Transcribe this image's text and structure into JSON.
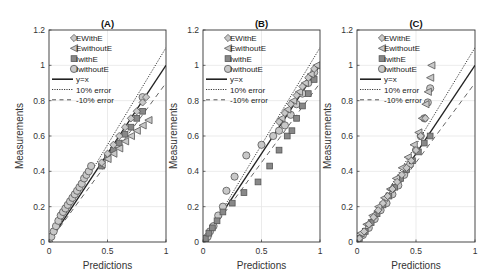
{
  "figure": {
    "x_label": "Predictions",
    "y_label": "Measurements",
    "x_ticks": [
      "0",
      "0.5",
      "1"
    ],
    "y_ticks": [
      "0",
      "0.2",
      "0.4",
      "0.6",
      "0.8",
      "1",
      "1.2"
    ],
    "legend": [
      "EWithE",
      "EwithoutE",
      "IwithE",
      "IwithoutE",
      "y=x",
      "10% error",
      "-10% error"
    ],
    "colors": {
      "marker_fill": "#c8c8c8",
      "marker_edge": "#555555",
      "line": "#222222",
      "grid": "#e6e6e6",
      "axes": "#333333"
    }
  },
  "chart_data": [
    {
      "type": "scatter",
      "title": "(A)",
      "xlabel": "Predictions",
      "ylabel": "Measurements",
      "xlim": [
        0,
        1
      ],
      "ylim": [
        0,
        1.2
      ],
      "grid": true,
      "legend_position": "upper left",
      "reference_lines": [
        {
          "name": "y=x",
          "slope": 1.0,
          "style": "solid"
        },
        {
          "name": "10% error",
          "slope": 1.1,
          "style": "dotted"
        },
        {
          "name": "-10% error",
          "slope": 0.9,
          "style": "dashed"
        }
      ],
      "series": [
        {
          "name": "EWithE",
          "marker": "diamond",
          "x": [
            0.45,
            0.5,
            0.55,
            0.6,
            0.65,
            0.7,
            0.75,
            0.8,
            0.83
          ],
          "y": [
            0.45,
            0.5,
            0.55,
            0.6,
            0.65,
            0.7,
            0.74,
            0.79,
            0.82
          ]
        },
        {
          "name": "EwithoutE",
          "marker": "triangle-left",
          "x": [
            0.45,
            0.5,
            0.55,
            0.6,
            0.65,
            0.7,
            0.75,
            0.8,
            0.85
          ],
          "y": [
            0.44,
            0.47,
            0.5,
            0.53,
            0.57,
            0.6,
            0.63,
            0.66,
            0.69
          ]
        },
        {
          "name": "IwithE",
          "marker": "square",
          "x": [
            0.45,
            0.5,
            0.55,
            0.6,
            0.65,
            0.7,
            0.75,
            0.8
          ],
          "y": [
            0.43,
            0.48,
            0.52,
            0.56,
            0.61,
            0.65,
            0.7,
            0.74
          ]
        },
        {
          "name": "IwithoutE",
          "marker": "circle",
          "x": [
            0.0,
            0.02,
            0.04,
            0.06,
            0.08,
            0.1,
            0.12,
            0.14,
            0.16,
            0.18,
            0.2,
            0.22,
            0.24,
            0.26,
            0.28,
            0.3,
            0.32,
            0.34,
            0.36,
            0.8
          ],
          "y": [
            0.0,
            0.03,
            0.06,
            0.09,
            0.12,
            0.15,
            0.17,
            0.19,
            0.21,
            0.23,
            0.25,
            0.27,
            0.29,
            0.31,
            0.33,
            0.36,
            0.38,
            0.4,
            0.43,
            0.82
          ]
        }
      ]
    },
    {
      "type": "scatter",
      "title": "(B)",
      "xlabel": "Predictions",
      "ylabel": "Measurements",
      "xlim": [
        0,
        1
      ],
      "ylim": [
        0,
        1.2
      ],
      "grid": true,
      "legend_position": "upper left",
      "reference_lines": [
        {
          "name": "y=x",
          "slope": 1.0,
          "style": "solid"
        },
        {
          "name": "10% error",
          "slope": 1.1,
          "style": "dotted"
        },
        {
          "name": "-10% error",
          "slope": 0.9,
          "style": "dashed"
        }
      ],
      "series": [
        {
          "name": "EWithE",
          "marker": "diamond",
          "x": [
            0.65,
            0.7,
            0.75,
            0.8,
            0.85,
            0.9,
            0.95
          ],
          "y": [
            0.68,
            0.73,
            0.78,
            0.83,
            0.88,
            0.93,
            0.98
          ]
        },
        {
          "name": "EwithoutE",
          "marker": "triangle-left",
          "x": [
            0.67,
            0.72,
            0.77,
            0.82,
            0.87,
            0.92,
            0.97
          ],
          "y": [
            0.7,
            0.75,
            0.8,
            0.85,
            0.9,
            0.95,
            1.0
          ]
        },
        {
          "name": "IwithE",
          "marker": "square",
          "x": [
            0.02,
            0.05,
            0.08,
            0.12,
            0.17,
            0.25,
            0.35,
            0.47,
            0.57,
            0.65,
            0.72,
            0.76,
            0.8,
            0.85,
            0.9,
            0.95
          ],
          "y": [
            0.02,
            0.05,
            0.08,
            0.12,
            0.17,
            0.22,
            0.28,
            0.34,
            0.43,
            0.52,
            0.6,
            0.63,
            0.7,
            0.77,
            0.84,
            0.92
          ]
        },
        {
          "name": "IwithoutE",
          "marker": "circle",
          "x": [
            0.0,
            0.02,
            0.04,
            0.06,
            0.09,
            0.13,
            0.17,
            0.2,
            0.27,
            0.37,
            0.5,
            0.6,
            0.65,
            0.7,
            0.75,
            0.8,
            0.85,
            0.9,
            0.95
          ],
          "y": [
            0.0,
            0.01,
            0.03,
            0.06,
            0.09,
            0.15,
            0.2,
            0.29,
            0.37,
            0.49,
            0.55,
            0.6,
            0.63,
            0.66,
            0.72,
            0.78,
            0.84,
            0.9,
            0.96
          ]
        }
      ]
    },
    {
      "type": "scatter",
      "title": "(C)",
      "xlabel": "Predictions",
      "ylabel": "Measurements",
      "xlim": [
        0,
        1
      ],
      "ylim": [
        0,
        1.2
      ],
      "grid": true,
      "legend_position": "upper left",
      "reference_lines": [
        {
          "name": "y=x",
          "slope": 1.0,
          "style": "solid"
        },
        {
          "name": "10% error",
          "slope": 1.1,
          "style": "dotted"
        },
        {
          "name": "-10% error",
          "slope": 0.9,
          "style": "dashed"
        }
      ],
      "series": [
        {
          "name": "EWithE",
          "marker": "diamond",
          "x": [
            0.02,
            0.06,
            0.1,
            0.14,
            0.18,
            0.22,
            0.26,
            0.3,
            0.34,
            0.38,
            0.42,
            0.46,
            0.5,
            0.54,
            0.58
          ],
          "y": [
            0.02,
            0.06,
            0.1,
            0.14,
            0.18,
            0.22,
            0.26,
            0.3,
            0.34,
            0.38,
            0.42,
            0.46,
            0.52,
            0.6,
            0.7
          ]
        },
        {
          "name": "EwithoutE",
          "marker": "triangle-left",
          "x": [
            0.03,
            0.08,
            0.13,
            0.18,
            0.23,
            0.28,
            0.33,
            0.38,
            0.43,
            0.48,
            0.52,
            0.55,
            0.58,
            0.6,
            0.62,
            0.63
          ],
          "y": [
            0.05,
            0.1,
            0.15,
            0.2,
            0.25,
            0.3,
            0.36,
            0.42,
            0.48,
            0.55,
            0.62,
            0.7,
            0.78,
            0.85,
            0.93,
            1.0
          ]
        },
        {
          "name": "IwithE",
          "marker": "square",
          "x": [
            0.02,
            0.07,
            0.12,
            0.17,
            0.22,
            0.27,
            0.32,
            0.37,
            0.42,
            0.47,
            0.52,
            0.57,
            0.62
          ],
          "y": [
            0.02,
            0.06,
            0.11,
            0.16,
            0.21,
            0.26,
            0.31,
            0.36,
            0.41,
            0.46,
            0.51,
            0.56,
            0.6
          ]
        },
        {
          "name": "IwithoutE",
          "marker": "circle",
          "x": [
            0.0,
            0.05,
            0.1,
            0.15,
            0.2,
            0.25,
            0.3,
            0.35,
            0.4,
            0.45,
            0.5,
            0.54,
            0.57,
            0.6,
            0.62
          ],
          "y": [
            0.0,
            0.04,
            0.08,
            0.13,
            0.18,
            0.22,
            0.27,
            0.32,
            0.38,
            0.44,
            0.52,
            0.6,
            0.7,
            0.79,
            0.87
          ]
        }
      ]
    }
  ]
}
